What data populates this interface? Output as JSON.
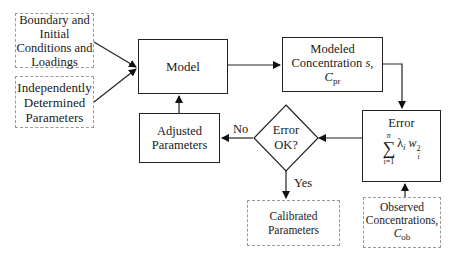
{
  "diagram": {
    "type": "flowchart",
    "nodes": {
      "boundary": {
        "lines": [
          "Boundary and",
          "Initial",
          "Conditions and",
          "Loadings"
        ],
        "style": "dashed"
      },
      "independent": {
        "lines": [
          "Independently",
          "Determined",
          "Parameters"
        ],
        "style": "dashed"
      },
      "model": {
        "label": "Model",
        "style": "solid"
      },
      "modeled": {
        "line1": "Modeled",
        "line2_prefix": "Concentration ",
        "line2_var": "s",
        "line2_sep": ", ",
        "line2_sym": "C",
        "line2_sub": "pr",
        "style": "solid"
      },
      "error": {
        "title": "Error",
        "sum_top": "n",
        "sum_symbol": "∑",
        "sum_bottom": "i=1",
        "term_lambda": "λ",
        "term_lambda_sub": "i",
        "term_w": "w",
        "term_w_sub": "i",
        "term_w_sup": "2",
        "style": "solid"
      },
      "decision": {
        "lines": [
          "Error",
          "OK?"
        ],
        "shape": "diamond"
      },
      "adjusted": {
        "lines": [
          "Adjusted",
          "Parameters"
        ],
        "style": "solid"
      },
      "calibrated": {
        "lines": [
          "Calibrated",
          "Parameters"
        ],
        "style": "dashed"
      },
      "observed": {
        "line1": "Observed",
        "line2": "Concentrations,",
        "sym": "C",
        "sub": "ob",
        "style": "dashed"
      }
    },
    "edge_labels": {
      "no": "No",
      "yes": "Yes"
    },
    "edges": [
      {
        "from": "boundary",
        "to": "model"
      },
      {
        "from": "independent",
        "to": "model"
      },
      {
        "from": "model",
        "to": "modeled"
      },
      {
        "from": "modeled",
        "to": "error"
      },
      {
        "from": "observed",
        "to": "error"
      },
      {
        "from": "error",
        "to": "decision"
      },
      {
        "from": "decision",
        "to": "adjusted",
        "label": "No"
      },
      {
        "from": "decision",
        "to": "calibrated",
        "label": "Yes"
      },
      {
        "from": "adjusted",
        "to": "model"
      }
    ]
  }
}
